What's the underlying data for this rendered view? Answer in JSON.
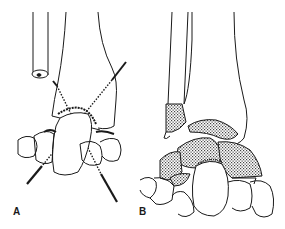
{
  "figure": {
    "panels": [
      {
        "id": "A",
        "label": "A",
        "description": "Wrist/ankle joint with crossing dotted lines and pins"
      },
      {
        "id": "B",
        "label": "B",
        "description": "Joint with stippled shaded bone fragments"
      }
    ],
    "colors": {
      "line": "#1a1a1a",
      "background": "#ffffff",
      "stipple": "#555555"
    }
  }
}
